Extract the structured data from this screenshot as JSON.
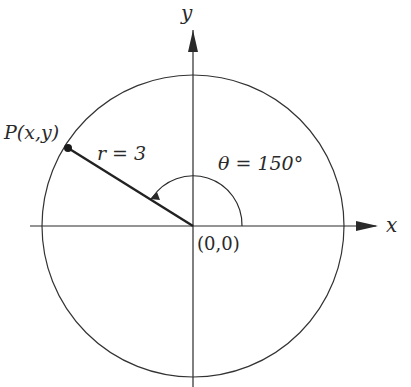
{
  "diagram": {
    "axis_x_label": "x",
    "axis_y_label": "y",
    "origin_label": "(0,0)",
    "point_label": "P(x,y)",
    "radius_label": "r = 3",
    "angle_label": "θ = 150°",
    "radius": 3,
    "angle_degrees": 150,
    "colors": {
      "stroke": "#2a2a2a",
      "background": "#ffffff"
    }
  }
}
